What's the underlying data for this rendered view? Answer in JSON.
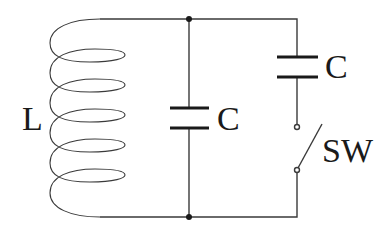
{
  "diagram": {
    "type": "circuit",
    "components": [
      {
        "id": "inductor",
        "kind": "inductor-coil",
        "label": "L",
        "turns": 5
      },
      {
        "id": "cap1",
        "kind": "capacitor",
        "label": "C",
        "position": "middle branch"
      },
      {
        "id": "cap2",
        "kind": "capacitor",
        "label": "C",
        "position": "right branch, series with switch"
      },
      {
        "id": "switch",
        "kind": "switch",
        "label": "SW",
        "state": "open"
      }
    ],
    "junctions": 2,
    "colors": {
      "line": "#333333",
      "background": "#ffffff"
    }
  },
  "labels": {
    "inductor": "L",
    "capacitor_middle": "C",
    "capacitor_right": "C",
    "switch": "SW"
  }
}
